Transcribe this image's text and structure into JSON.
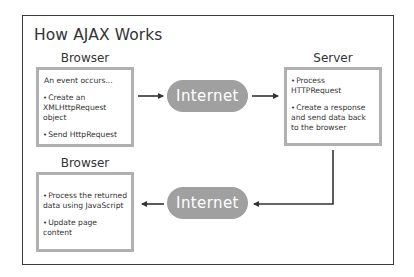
{
  "title": "How AJAX Works",
  "nodes": {
    "browser_top": {
      "label": "Browser",
      "lines": [
        {
          "bullet": "",
          "text": "An event occurs..."
        },
        {
          "bullet": "•",
          "text": "Create an XMLHttpRequest object"
        },
        {
          "bullet": "•",
          "text": "Send HttpRequest"
        }
      ]
    },
    "server": {
      "label": "Server",
      "lines": [
        {
          "bullet": "•",
          "text": "Process HTTPRequest"
        },
        {
          "bullet": "•",
          "text": "Create a response and send data back to the browser"
        }
      ]
    },
    "browser_bottom": {
      "label": "Browser",
      "lines": [
        {
          "bullet": "•",
          "text": "Process the returned data using JavaScript"
        },
        {
          "bullet": "•",
          "text": "Update page content"
        }
      ]
    },
    "internet_top": {
      "label": "Internet"
    },
    "internet_bottom": {
      "label": "Internet"
    }
  },
  "edges": [
    {
      "from": "browser_top",
      "to": "internet_top"
    },
    {
      "from": "internet_top",
      "to": "server"
    },
    {
      "from": "server",
      "to": "internet_bottom"
    },
    {
      "from": "internet_bottom",
      "to": "browser_bottom"
    }
  ],
  "colors": {
    "box_border": "#b0b0b0",
    "pill_fill": "#a0a0a0",
    "arrow": "#333333",
    "frame": "#3a3a3a"
  }
}
